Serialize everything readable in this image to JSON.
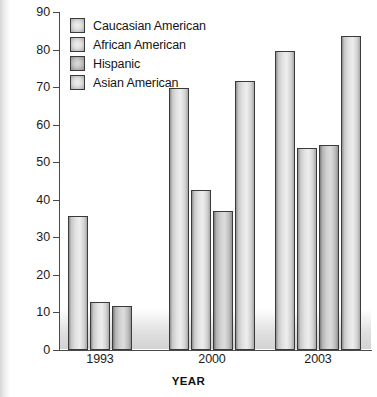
{
  "chart_data": {
    "type": "bar",
    "title": "",
    "xlabel": "YEAR",
    "ylabel": "PERCENTAGE",
    "categories": [
      "1993",
      "2000",
      "2003"
    ],
    "ylim": [
      0,
      90
    ],
    "yticks": [
      0,
      10,
      20,
      30,
      40,
      50,
      60,
      70,
      80,
      90
    ],
    "grid": false,
    "legend_position": "top-left",
    "series": [
      {
        "name": "Caucasian American",
        "values": [
          35.7,
          69.8,
          79.7
        ]
      },
      {
        "name": "African American",
        "values": [
          12.8,
          42.6,
          53.7
        ]
      },
      {
        "name": "Hispanic",
        "values": [
          11.7,
          37.0,
          54.5
        ]
      },
      {
        "name": "Asian American",
        "values": [
          null,
          71.7,
          83.5
        ]
      }
    ],
    "colors": {
      "bar_fill_light": "#e3e3e3",
      "bar_fill_dark": "#c2c2c2",
      "bar_outline": "#3a3a3a",
      "axis": "#4a4a4a",
      "text": "#141414",
      "background": "#ffffff"
    }
  },
  "legend": {
    "items": [
      {
        "label": "Caucasian American",
        "swatch": "legend-swatch-caucasian-american"
      },
      {
        "label": "African American",
        "swatch": "legend-swatch-african-american"
      },
      {
        "label": "Hispanic",
        "swatch": "legend-swatch-hispanic"
      },
      {
        "label": "Asian American",
        "swatch": "legend-swatch-asian-american"
      }
    ]
  },
  "axes": {
    "y": {
      "title": "PERCENTAGE",
      "ticks": [
        "90",
        "80",
        "70",
        "60",
        "50",
        "40",
        "30",
        "20",
        "10",
        "0"
      ]
    },
    "x": {
      "title": "YEAR",
      "ticks": [
        "1993",
        "2000",
        "2003"
      ]
    }
  }
}
